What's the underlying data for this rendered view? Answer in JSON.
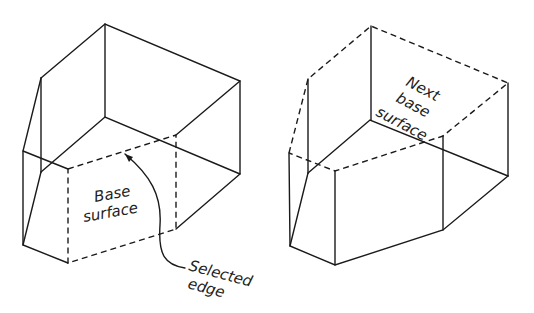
{
  "figures": [
    {
      "id": "left",
      "labels": {
        "base_surface_line1": "Base",
        "base_surface_line2": "surface",
        "selected_edge_line1": "Selected",
        "selected_edge_line2": "edge"
      }
    },
    {
      "id": "right",
      "labels": {
        "next_line1": "Next",
        "next_line2": "base",
        "next_line3": "surface"
      }
    }
  ],
  "colors": {
    "line": "#1a1a1a",
    "background": "#ffffff"
  }
}
